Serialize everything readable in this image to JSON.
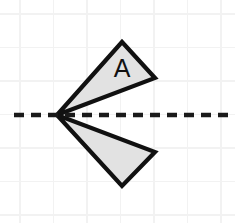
{
  "canvas": {
    "width": 235,
    "height": 223,
    "background_color": "#ffffff"
  },
  "grid": {
    "line_color": "#f2f2f2",
    "spacing": 33.5,
    "x_positions": [
      20,
      53.5,
      87,
      120.5,
      154,
      187.5,
      221
    ],
    "y_positions": [
      14,
      47.5,
      81,
      114.5,
      148,
      181.5,
      215
    ]
  },
  "mirror_line": {
    "label": "line of reflection",
    "orientation": "horizontal",
    "color": "#1a1a1a",
    "y": 115,
    "x_start": 14,
    "x_end": 232,
    "dash_length": 10,
    "gap_length": 7,
    "stroke_width": 4.4
  },
  "shapes": [
    {
      "name": "triangle-a",
      "label": "A",
      "label_x": 122,
      "label_y": 68,
      "fill_color": "#e2e2e2",
      "stroke_color": "#111111",
      "stroke_width": 4.2,
      "points": "57,115 122,42 155,78"
    },
    {
      "name": "triangle-a-image",
      "label": "",
      "label_x": 0,
      "label_y": 0,
      "fill_color": "#e2e2e2",
      "stroke_color": "#111111",
      "stroke_width": 4.2,
      "points": "57,115 155,152 122,186"
    }
  ],
  "vertex": {
    "x": 57,
    "y": 115
  }
}
